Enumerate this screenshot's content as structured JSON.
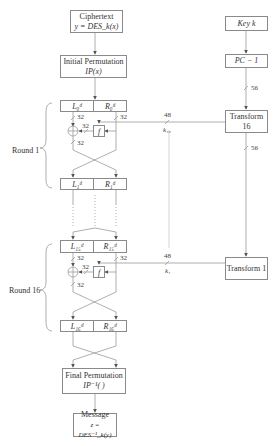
{
  "diagram": {
    "ciphertext": {
      "line1": "Ciphertext",
      "line2": "y = DES_k(x)"
    },
    "initial_permutation": {
      "line1": "Initial Permutation",
      "line2": "IP(x)"
    },
    "final_permutation": {
      "line1": "Final Permutation",
      "line2": "IP⁻¹( )"
    },
    "message": {
      "line1": "Message",
      "line2": "z = DES⁻¹_k(y)"
    },
    "key": {
      "label": "Key k"
    },
    "pc1": {
      "label": "PC − 1"
    },
    "transform16": {
      "label": "Transform 16"
    },
    "transform1": {
      "label": "Transform 1"
    },
    "rounds": [
      {
        "label": "Round 1",
        "input_left": "L₀ᵈ",
        "input_right": "R₀ᵈ",
        "output_left": "L₁ᵈ",
        "output_right": "R₁ᵈ",
        "subkey": "k₁₆",
        "subkey_bits": "48",
        "f_label": "f",
        "bits": "32"
      },
      {
        "label": "Round 16",
        "input_left": "L₁₅ᵈ",
        "input_right": "R₁₅ᵈ",
        "output_left": "L₁₆ᵈ",
        "output_right": "R₁₆ᵈ",
        "subkey": "k₁",
        "subkey_bits": "48",
        "f_label": "f",
        "bits": "32"
      }
    ],
    "key_bits": "56"
  }
}
